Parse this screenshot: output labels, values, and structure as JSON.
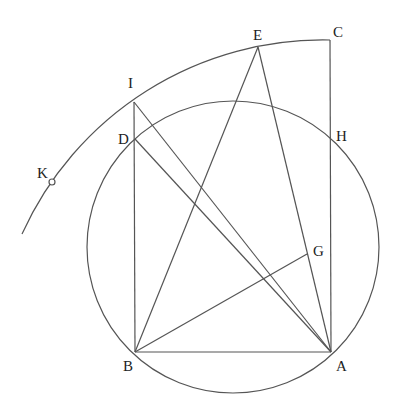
{
  "figure": {
    "type": "geometric-construction",
    "stroke_color": "#555555",
    "label_color": "#222222",
    "background": "#ffffff"
  },
  "points": {
    "A": {
      "label": "A",
      "x": 331,
      "y": 352
    },
    "B": {
      "label": "B",
      "x": 135,
      "y": 352
    },
    "C": {
      "label": "C",
      "x": 330,
      "y": 40
    },
    "D": {
      "label": "D",
      "x": 135,
      "y": 139
    },
    "E": {
      "label": "E",
      "x": 258,
      "y": 47
    },
    "G": {
      "label": "G",
      "x": 307,
      "y": 254
    },
    "H": {
      "label": "H",
      "x": 330,
      "y": 140
    },
    "I": {
      "label": "I",
      "x": 134,
      "y": 102
    },
    "K": {
      "label": "K",
      "x": 52,
      "y": 182
    }
  },
  "circle": {
    "cx": 233,
    "cy": 247,
    "r": 146
  },
  "arc": {
    "from": "C",
    "to_end": {
      "x": 22,
      "y": 234
    },
    "radius": 330
  },
  "segments": [
    [
      "B",
      "A"
    ],
    [
      "B",
      "I"
    ],
    [
      "I",
      "A"
    ],
    [
      "D",
      "A"
    ],
    [
      "B",
      "E"
    ],
    [
      "E",
      "A"
    ],
    [
      "C",
      "A"
    ],
    [
      "B",
      "G"
    ]
  ]
}
